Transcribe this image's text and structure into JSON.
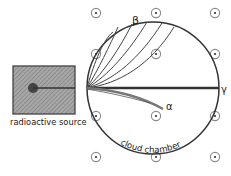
{
  "diagram": {
    "labels": {
      "beta": "β",
      "gamma": "γ",
      "alpha": "α",
      "source": "radioactive source",
      "chamber": "cloud chamber"
    },
    "field": {
      "symbol": "out-of-page-field-icon",
      "count": 12
    },
    "tracks": [
      {
        "name": "gamma",
        "deflection": "none"
      },
      {
        "name": "alpha",
        "deflection": "slight-down"
      },
      {
        "name": "beta",
        "deflection": "strong-up",
        "count": 6
      }
    ],
    "colors": {
      "ink": "#333333",
      "source_fill": "#9a9a9a",
      "hatch": "#6e6e6e",
      "field_ring": "#999999",
      "alpha_track": "#777777"
    }
  }
}
